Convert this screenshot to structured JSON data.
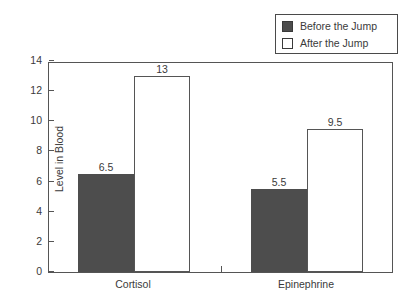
{
  "chart_data": {
    "type": "bar",
    "title": "",
    "xlabel": "",
    "ylabel": "Level in Blood",
    "categories": [
      "Cortisol",
      "Epinephrine"
    ],
    "series": [
      {
        "name": "Before the Jump",
        "values": [
          6.5,
          5.5
        ],
        "color": "#4d4d4d"
      },
      {
        "name": "After the Jump",
        "values": [
          13,
          9.5
        ],
        "color": "#ffffff"
      }
    ],
    "value_labels": [
      [
        "6.5",
        "13"
      ],
      [
        "5.5",
        "9.5"
      ]
    ],
    "ylim": [
      0,
      14
    ],
    "yticks": [
      0,
      2,
      4,
      6,
      8,
      10,
      12,
      14
    ],
    "ytick_labels": [
      "0",
      "2",
      "4",
      "6",
      "8",
      "10",
      "12",
      "14"
    ],
    "grid": false,
    "legend_position": "top-right"
  },
  "legend": {
    "entries": [
      {
        "label": "Before the Jump",
        "swatch_color": "#4d4d4d"
      },
      {
        "label": "After the Jump",
        "swatch_color": "#ffffff"
      }
    ]
  },
  "axes": {
    "y_title": "Level in Blood"
  }
}
